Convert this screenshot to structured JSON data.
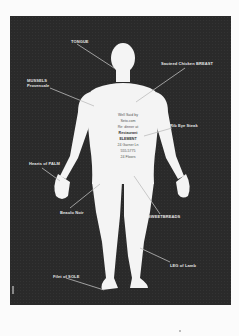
{
  "poster": {
    "background": "#2a2a2a",
    "figure_color": "#f4f4f4",
    "labels": [
      {
        "id": "tongue",
        "text": "TONGUE"
      },
      {
        "id": "mussels",
        "line1": "MUSSELS",
        "line2": "Provencale"
      },
      {
        "id": "chicken",
        "text": "Sauteed Chicken BREAST"
      },
      {
        "id": "ribeye",
        "text": "Rib Eye Steak"
      },
      {
        "id": "palm",
        "text": "Hearts of PALM"
      },
      {
        "id": "sweetbreads",
        "text": "SWEETBREADS"
      },
      {
        "id": "beaujolais",
        "text": "Beaulo Noir"
      },
      {
        "id": "lamb",
        "text": "LEG of Lamb"
      },
      {
        "id": "sole",
        "text": "Filet of SOLE"
      }
    ],
    "center_text": [
      "Well Said by",
      "Seto.com",
      "Re: dinner at",
      "Restaurant",
      "ELEMENT",
      "24 Garner Ln",
      "555-5775",
      "24 Floors"
    ]
  }
}
